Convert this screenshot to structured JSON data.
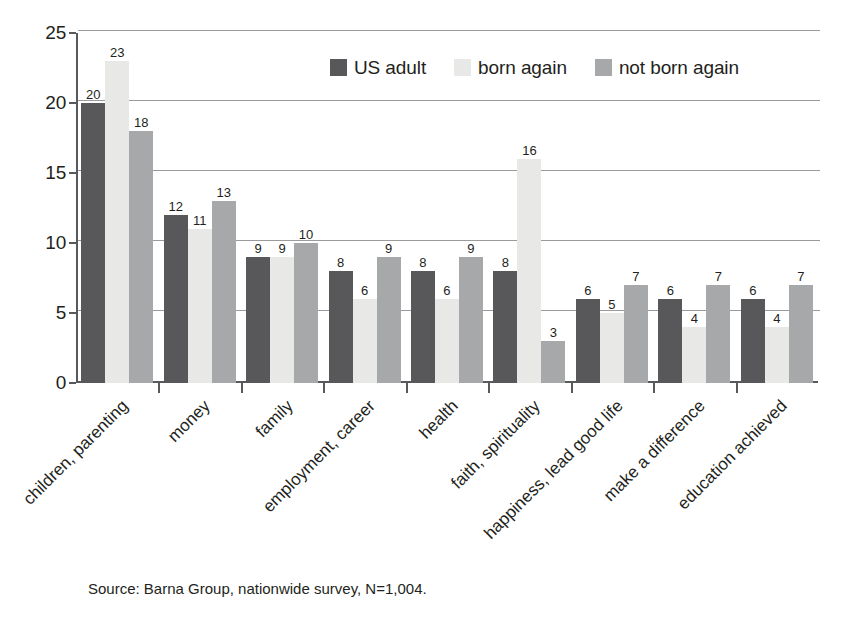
{
  "chart_data": {
    "type": "bar",
    "title": "",
    "xlabel": "",
    "ylabel": "",
    "ylim": [
      0,
      25
    ],
    "yticks": [
      0,
      5,
      10,
      15,
      20,
      25
    ],
    "grid": true,
    "legend_position": "top-center",
    "categories": [
      "children, parenting",
      "money",
      "family",
      "employment, career",
      "health",
      "faith, spirituality",
      "happiness, lead good life",
      "make a difference",
      "education achieved"
    ],
    "series": [
      {
        "name": "US adult",
        "color": "#58585a",
        "values": [
          20,
          12,
          9,
          8,
          8,
          8,
          6,
          6,
          6
        ]
      },
      {
        "name": "born again",
        "color": "#e8e8e6",
        "values": [
          23,
          11,
          9,
          6,
          6,
          16,
          5,
          4,
          4
        ]
      },
      {
        "name": "not born again",
        "color": "#a7a8aa",
        "values": [
          18,
          13,
          10,
          9,
          9,
          3,
          7,
          7,
          7
        ]
      }
    ],
    "source_note": "Source: Barna Group, nationwide survey, N=1,004."
  },
  "legend": {
    "items": [
      {
        "label": "US adult"
      },
      {
        "label": "born again"
      },
      {
        "label": "not born again"
      }
    ]
  },
  "axes": {
    "y_tick_labels": [
      "25",
      "20",
      "15",
      "10",
      "5",
      "0"
    ]
  },
  "footer": {
    "source": "Source: Barna Group, nationwide survey, N=1,004."
  }
}
